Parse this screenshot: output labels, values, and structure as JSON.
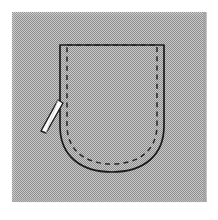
{
  "figure": {
    "alt_text": "Technical sewing illustration of a rounded patch pocket outlined in solid black with a dashed topstitching line inside, a tailor's chalk marker at the left edge, shown on a dithered gray halftone panel.",
    "width": 218,
    "height": 220
  },
  "canvas": {
    "page_background": "#ffffff",
    "panel_background": "#b3b3b3",
    "panel_dither_light": "#dcdcdc",
    "panel_dither_dark": "#8f8f8f",
    "panel": {
      "x": 11,
      "y": 11,
      "width": 196,
      "height": 192
    }
  },
  "pocket": {
    "outline": {
      "name": "pocket-outline",
      "style": "solid",
      "color": "#1a1a1a",
      "stroke_width": 1.6,
      "geometry": {
        "top_y": 45,
        "left_x": 60,
        "right_x": 164,
        "straight_bottom_y": 125,
        "curve_bottom_y": 172
      }
    },
    "topstitch": {
      "name": "pocket-topstitch",
      "style": "dashed",
      "color": "#262626",
      "stroke_width": 1.5,
      "dash_pattern": "5 4",
      "inset": 7
    },
    "curve_type": "U-shaped rounded bottom"
  },
  "marker": {
    "name": "tailors-chalk-marker",
    "fill": "#fdfdfd",
    "stroke": "#1a1a1a",
    "stroke_width": 1.4,
    "angle_degrees": 22,
    "position": {
      "x": 42,
      "y": 100,
      "length": 34,
      "width": 9
    }
  },
  "labels": {
    "pocket": "patch pocket",
    "stitch_line": "topstitching line",
    "tool": "tailor's chalk marker"
  },
  "colors": {
    "ink": "#1a1a1a",
    "stitch": "#262626",
    "panel": "#b3b3b3",
    "highlight": "#fdfdfd"
  }
}
